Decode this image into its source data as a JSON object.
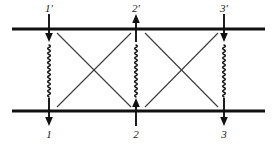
{
  "figure": {
    "background_color": "#ffffff",
    "ink_color": "#111111",
    "diagonal_color": "#3a3a3a",
    "width": 279,
    "height": 146
  },
  "rails": [
    {
      "name": "upper-level-line",
      "y": 29,
      "x_start": 12,
      "x_end": 265
    },
    {
      "name": "lower-level-line",
      "y": 111,
      "x_start": 12,
      "x_end": 265
    }
  ],
  "columns": [
    {
      "id": "col1",
      "x": 49
    },
    {
      "id": "col2",
      "x": 136
    },
    {
      "id": "col3",
      "x": 224
    }
  ],
  "top_labels": [
    {
      "id": "t1",
      "text": "1'",
      "x": 49,
      "y": 3
    },
    {
      "id": "t2",
      "text": "2'",
      "x": 136,
      "y": 3
    },
    {
      "id": "t3",
      "text": "3'",
      "x": 224,
      "y": 3
    }
  ],
  "bottom_labels": [
    {
      "id": "b1",
      "text": "1",
      "x": 49,
      "y": 129
    },
    {
      "id": "b2",
      "text": "2",
      "x": 136,
      "y": 129
    },
    {
      "id": "b3",
      "text": "3",
      "x": 224,
      "y": 129
    }
  ],
  "top_arrows": [
    {
      "id": "a1p",
      "column": "col1",
      "direction": "down",
      "from_y": 14,
      "to_y": 42
    },
    {
      "id": "a2p",
      "column": "col2",
      "direction": "up",
      "from_y": 42,
      "to_y": 14
    },
    {
      "id": "a3p",
      "column": "col3",
      "direction": "down",
      "from_y": 14,
      "to_y": 42
    }
  ],
  "bottom_arrows": [
    {
      "id": "a1",
      "column": "col1",
      "direction": "down",
      "from_y": 98,
      "to_y": 126
    },
    {
      "id": "a2",
      "column": "col2",
      "direction": "up",
      "from_y": 126,
      "to_y": 98
    },
    {
      "id": "a3",
      "column": "col3",
      "direction": "down",
      "from_y": 98,
      "to_y": 126
    }
  ],
  "squiggles": [
    {
      "id": "w1",
      "column": "col1",
      "y_start": 45,
      "y_end": 97,
      "amplitude": 2.6,
      "periods": 11
    },
    {
      "id": "w2",
      "column": "col2",
      "y_start": 45,
      "y_end": 97,
      "amplitude": 2.6,
      "periods": 11
    },
    {
      "id": "w3",
      "column": "col3",
      "y_start": 45,
      "y_end": 97,
      "amplitude": 2.6,
      "periods": 11
    }
  ],
  "crossings": [
    {
      "id": "x-left",
      "name": "crossing-1-2",
      "lines": [
        {
          "x1": 57,
          "y1": 33,
          "x2": 131,
          "y2": 107
        },
        {
          "x1": 131,
          "y1": 33,
          "x2": 57,
          "y2": 107
        }
      ]
    },
    {
      "id": "x-right",
      "name": "crossing-2-3",
      "lines": [
        {
          "x1": 145,
          "y1": 33,
          "x2": 218,
          "y2": 107
        },
        {
          "x1": 218,
          "y1": 33,
          "x2": 145,
          "y2": 107
        }
      ]
    }
  ]
}
